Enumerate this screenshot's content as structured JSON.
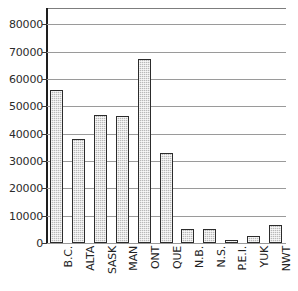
{
  "chart_data": {
    "type": "bar",
    "title": "",
    "subtitle": "",
    "xlabel": "",
    "ylabel": "",
    "categories": [
      "B.C.",
      "ALTA",
      "SASK",
      "MAN",
      "ONT",
      "QUE",
      "N.B.",
      "N.S.",
      "P.E.I.",
      "YUK",
      "NWT"
    ],
    "values": [
      56000,
      38000,
      47000,
      46500,
      67500,
      33000,
      5000,
      5200,
      1000,
      2500,
      6500
    ],
    "ylim": [
      0,
      86000
    ],
    "ytick_labels": [
      "0",
      "10000",
      "20000",
      "30000",
      "40000",
      "50000",
      "60000",
      "70000",
      "80000"
    ],
    "ytick_values": [
      0,
      10000,
      20000,
      30000,
      40000,
      50000,
      60000,
      70000,
      80000
    ],
    "grid": true,
    "legend": null,
    "bar_fill_color": "#b9b9b9",
    "bar_edge_color": "#2c2c2c",
    "gridline_color": "#9a9a9a",
    "axis_color": "#1e1e1e"
  }
}
